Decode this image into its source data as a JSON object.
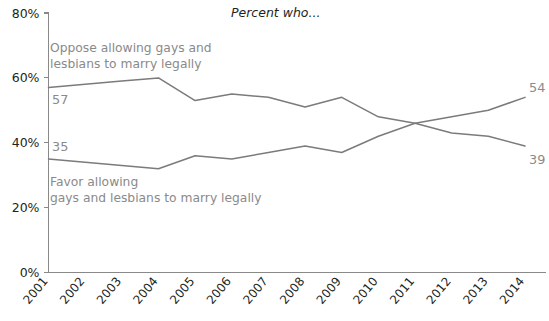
{
  "chart_data": {
    "type": "line",
    "title": "Percent who...",
    "xlabel": "",
    "ylabel": "",
    "x": [
      "2001",
      "2002",
      "2003",
      "2004",
      "2005",
      "2006",
      "2007",
      "2008",
      "2009",
      "2010",
      "2011",
      "2012",
      "2013",
      "2014"
    ],
    "categories": [
      "2001",
      "2002",
      "2003",
      "2004",
      "2005",
      "2006",
      "2007",
      "2008",
      "2009",
      "2010",
      "2011",
      "2012",
      "2013",
      "2014"
    ],
    "ylim": [
      0,
      80
    ],
    "ytick_labels": [
      "0%",
      "20%",
      "40%",
      "60%",
      "80%"
    ],
    "ytick_values": [
      0,
      20,
      40,
      60,
      80
    ],
    "grid": false,
    "legend_position": "inline-annotations",
    "series": [
      {
        "name": "Oppose allowing gays and lesbians to marry legally",
        "values": [
          57,
          58,
          59,
          60,
          53,
          55,
          54,
          51,
          54,
          48,
          46,
          43,
          42,
          39
        ],
        "color": "#7b7b7b",
        "start_label": "57",
        "end_label": "39"
      },
      {
        "name": "Favor allowing gays and lesbians to marry legally",
        "values": [
          35,
          34,
          33,
          32,
          36,
          35,
          37,
          39,
          37,
          42,
          46,
          48,
          50,
          54
        ],
        "color": "#7b7b7b",
        "start_label": "35",
        "end_label": "54"
      }
    ],
    "annotations": [
      {
        "id": "oppose-annotation",
        "line1": "Oppose allowing gays and",
        "line2": "lesbians to marry legally"
      },
      {
        "id": "favor-annotation",
        "line1": "Favor allowing",
        "line2": "gays and lesbians to marry legally"
      }
    ]
  }
}
